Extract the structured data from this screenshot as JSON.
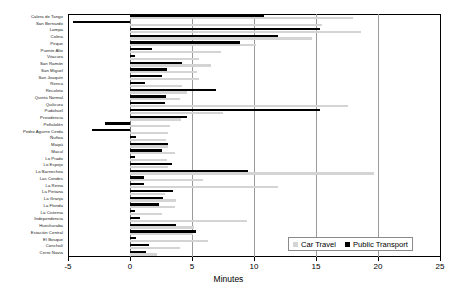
{
  "chart_data": {
    "type": "bar",
    "orientation": "horizontal",
    "title": "",
    "xlabel": "Minutes",
    "ylabel": "",
    "xlim": [
      -5,
      25
    ],
    "xticks": [
      -5,
      0,
      5,
      10,
      15,
      20,
      25
    ],
    "grid": true,
    "legend_position": "bottom-right",
    "series": [
      {
        "name": "Car Travel",
        "color": "#d4d4d4",
        "values": [
          18.0,
          15.5,
          18.6,
          14.7,
          10.2,
          7.3,
          5.6,
          6.5,
          5.4,
          5.6,
          4.2,
          4.6,
          4.0,
          17.6,
          7.5,
          4.1,
          3.2,
          3.1,
          2.9,
          3.1,
          3.6,
          3.0,
          3.1,
          19.7,
          5.9,
          11.9,
          2.8,
          3.7,
          3.6,
          2.6,
          9.4,
          5.2,
          5.1,
          6.3,
          4.0,
          2.2
        ]
      },
      {
        "name": "Public Transport",
        "color": "#000000",
        "values": [
          10.8,
          -4.6,
          15.3,
          11.9,
          8.9,
          1.8,
          0.4,
          4.2,
          3.0,
          2.6,
          1.2,
          6.9,
          2.9,
          2.8,
          15.3,
          4.6,
          -2.0,
          -3.1,
          0.5,
          3.1,
          2.6,
          0.4,
          3.4,
          9.5,
          1.1,
          1.1,
          3.5,
          2.7,
          2.3,
          0.4,
          0.8,
          3.7,
          5.3,
          0.5,
          1.5,
          1.3
        ]
      }
    ],
    "categories": [
      "Calera de Tango",
      "San Bernardo",
      "Lampa",
      "Colina",
      "Pirque",
      "Puente Alto",
      "Vitacura",
      "San Ramón",
      "San Miguel",
      "San Joaquín",
      "Renca",
      "Recoleta",
      "Quinta Normal",
      "Quilicura",
      "Pudahuel",
      "Providencia",
      "Peñalolén",
      "Pedro Aguirre Cerda",
      "Ñuñoa",
      "Maipú",
      "Macul",
      "Lo Prado",
      "Lo Espejo",
      "Lo Barnechea",
      "Las Condes",
      "La Reina",
      "La Pintana",
      "La Granja",
      "La Florida",
      "La Cisterna",
      "Independencia",
      "Huechuraba",
      "Estación Central",
      "El Bosque",
      "Conchalí",
      "Cerro Navia"
    ]
  },
  "extra_categories_note": ""
}
